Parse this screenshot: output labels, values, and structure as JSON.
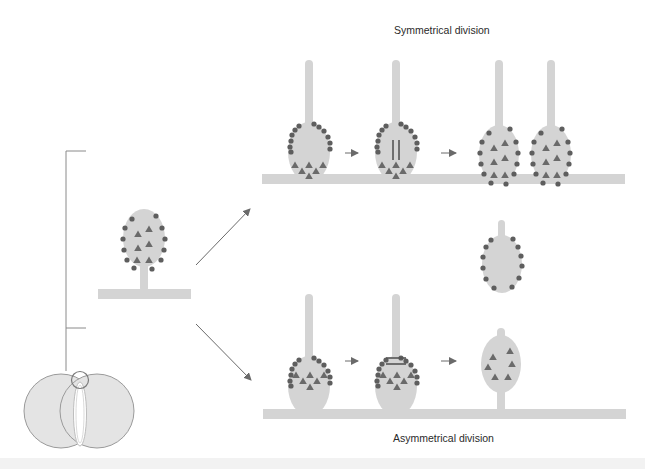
{
  "diagram": {
    "title_top": "Symmetrical division",
    "title_bottom": "Asymmetrical division",
    "colors": {
      "cell_fill": "#d4d4d4",
      "membrane_dots": "#5e5e5e",
      "cytoplasm_triangles": "#6a6a6a",
      "spindle": "#555555",
      "arrows": "#6a6a6a",
      "bracket_line": "#8a8a8a",
      "embryo_fill": "#e4e4e4",
      "embryo_outline": "#9a9a9a"
    },
    "stages": {
      "source": "Polarized stem cell with membrane-associated (dots) and cytoplasmic (triangles) determinants, attached to niche",
      "symmetrical": [
        "Polarized cell",
        "Spindle oriented parallel to niche (vertical)",
        "Two identical daughter cells remain attached"
      ],
      "asymmetrical": [
        "Polarized cell",
        "Spindle oriented perpendicular (horizontal)",
        "One daughter with dots detaches; one with triangles remains attached"
      ]
    },
    "embryo": "Embryo cross-section with highlighted region (circle) expanded via bracket"
  }
}
